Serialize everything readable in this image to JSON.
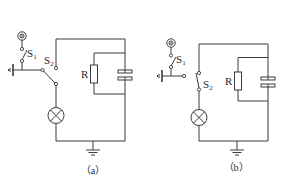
{
  "figure": {
    "panels": [
      {
        "id": "a",
        "caption": "（a）",
        "labels": {
          "switch1": "S",
          "switch1_sub": "1",
          "switch2": "S",
          "switch2_sub": "2",
          "resistor": "R"
        },
        "components": [
          "power-source",
          "switch-S1",
          "ground-side-terminal",
          "switch-S2 (two-way, at lower position)",
          "lamp",
          "resistor R",
          "capacitor",
          "ground"
        ]
      },
      {
        "id": "b",
        "caption": "（b）",
        "labels": {
          "switch1": "S",
          "switch1_sub": "1",
          "switch2": "S",
          "switch2_sub": "2",
          "resistor": "R"
        },
        "components": [
          "power-source",
          "switch-S1",
          "ground-side-terminal",
          "switch-S2 (in series with lamp)",
          "lamp",
          "resistor R",
          "capacitor",
          "ground"
        ]
      }
    ]
  }
}
